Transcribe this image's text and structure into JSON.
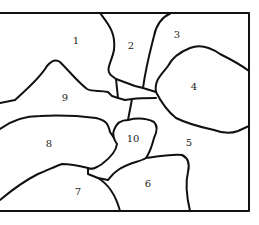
{
  "diagram": {
    "type": "region-map",
    "stroke_color": "#111111",
    "background_color": "#ffffff",
    "regions": [
      {
        "id": "1",
        "label": "1",
        "x": 76,
        "y": 41
      },
      {
        "id": "2",
        "label": "2",
        "x": 131,
        "y": 46
      },
      {
        "id": "3",
        "label": "3",
        "x": 177,
        "y": 35
      },
      {
        "id": "4",
        "label": "4",
        "x": 194,
        "y": 87
      },
      {
        "id": "5",
        "label": "5",
        "x": 189,
        "y": 143
      },
      {
        "id": "6",
        "label": "6",
        "x": 148,
        "y": 184
      },
      {
        "id": "7",
        "label": "7",
        "x": 78,
        "y": 192
      },
      {
        "id": "8",
        "label": "8",
        "x": 49,
        "y": 144
      },
      {
        "id": "9",
        "label": "9",
        "x": 65,
        "y": 98
      },
      {
        "id": "10",
        "label": "10",
        "x": 133,
        "y": 139
      }
    ]
  }
}
